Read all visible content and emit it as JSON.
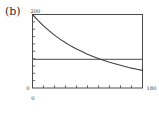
{
  "panel": {
    "label": "(b)"
  },
  "chart_data": {
    "type": "line",
    "title": "",
    "subtitle": "",
    "xlabel": "",
    "ylabel": "",
    "xlim": [
      0,
      180
    ],
    "ylim": [
      0,
      200
    ],
    "xticklabels": [
      "0",
      "180"
    ],
    "yticklabels": [
      "0",
      "200"
    ],
    "xtick_label_left": "0",
    "xtick_label_right": "180",
    "ytick_label_bottom": "0",
    "ytick_label_top": "200",
    "grid": false,
    "legend": false,
    "x_minor_tick_count": 9,
    "y_minor_tick_count": 9,
    "series": [
      {
        "name": "decay-curve",
        "type": "line",
        "color": "#404040",
        "x": [
          0,
          9,
          18,
          27,
          36,
          45,
          54,
          63,
          72,
          81,
          90,
          99,
          108,
          117,
          126,
          135,
          144,
          153,
          162,
          171,
          180
        ],
        "y": [
          200,
          184,
          169,
          156,
          144,
          133,
          123,
          114,
          106,
          99,
          92,
          86,
          80,
          75,
          70,
          66,
          62,
          58,
          54,
          51,
          48
        ]
      },
      {
        "name": "reference-level",
        "type": "hline",
        "color": "#6e6e6e",
        "x": [
          0,
          180
        ],
        "y": [
          78,
          78
        ],
        "value": 78
      }
    ],
    "annotations": [
      {
        "name": "crossing-point",
        "x": 106,
        "y": 78
      }
    ]
  },
  "colors": {
    "frame": "#4a4a4a",
    "curve": "#404040",
    "reference_line": "#6e6e6e",
    "text": "#3a3a3a",
    "background": "#ffffff"
  }
}
